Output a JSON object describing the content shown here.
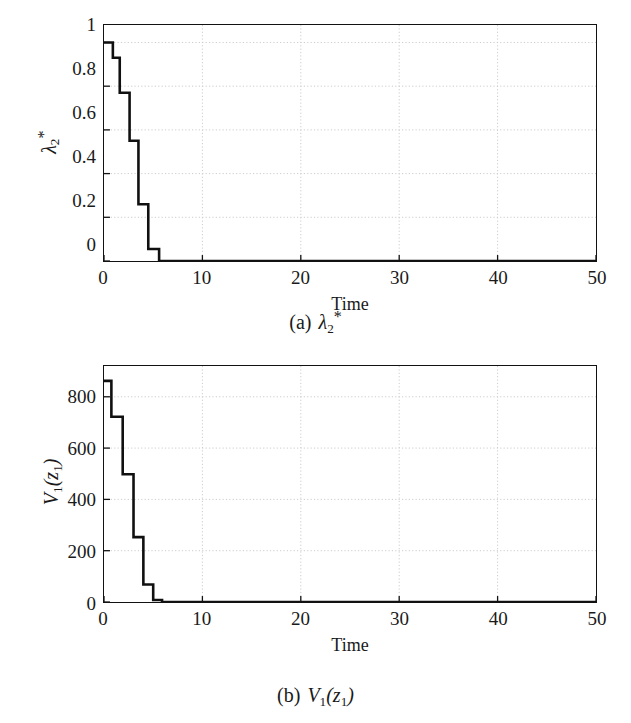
{
  "chart_data": [
    {
      "type": "line",
      "id": "a",
      "title": "",
      "xlabel": "Time",
      "ylabel": "λ₂*",
      "ylabel_parts": {
        "base": "λ",
        "sub": "2",
        "sup": "*"
      },
      "caption_label": "(a)",
      "caption_math": "λ₂*",
      "xlim": [
        0,
        50
      ],
      "ylim": [
        0,
        1.08
      ],
      "xticks": [
        0,
        10,
        20,
        30,
        40,
        50
      ],
      "xtick_labels": [
        "0",
        "10",
        "20",
        "30",
        "40",
        "50"
      ],
      "yticks": [
        0,
        0.2,
        0.4,
        0.6,
        0.8,
        1
      ],
      "ytick_labels": [
        "0",
        "0.2",
        "0.4",
        "0.6",
        "0.8",
        "1"
      ],
      "grid": true,
      "grid_color": "#cccccc",
      "line_color": "#101010",
      "line_width": 2.6,
      "step_style": "post",
      "x": [
        0,
        0.9,
        1.6,
        2.6,
        3.5,
        4.5,
        5.6,
        50
      ],
      "y": [
        1.0,
        0.93,
        0.77,
        0.55,
        0.26,
        0.055,
        0.0,
        0.0
      ]
    },
    {
      "type": "line",
      "id": "b",
      "title": "",
      "xlabel": "Time",
      "ylabel": "V₁(z₁)",
      "ylabel_parts": {
        "base": "V",
        "sub": "1",
        "arg": "z",
        "argsub": "1"
      },
      "caption_label": "(b)",
      "caption_math": "V₁(z₁)",
      "xlim": [
        0,
        50
      ],
      "ylim": [
        0,
        920
      ],
      "xticks": [
        0,
        10,
        20,
        30,
        40,
        50
      ],
      "xtick_labels": [
        "0",
        "10",
        "20",
        "30",
        "40",
        "50"
      ],
      "yticks": [
        0,
        200,
        400,
        600,
        800
      ],
      "ytick_labels": [
        "0",
        "200",
        "400",
        "600",
        "800"
      ],
      "grid": true,
      "grid_color": "#cccccc",
      "line_color": "#101010",
      "line_width": 2.6,
      "step_style": "post",
      "x": [
        0,
        0.75,
        1.9,
        3.0,
        4.0,
        5.0,
        5.9,
        50
      ],
      "y": [
        862,
        722,
        498,
        253,
        68,
        8,
        0,
        0
      ]
    }
  ],
  "figure_a": {
    "caption_label": "(a)",
    "caption_math": "λ₂*",
    "xlabel": "Time",
    "ytick_labels": [
      "1",
      "0.8",
      "0.6",
      "0.4",
      "0.2",
      "0"
    ],
    "xtick_labels": [
      "0",
      "10",
      "20",
      "30",
      "40",
      "50"
    ]
  },
  "figure_b": {
    "caption_label": "(b)",
    "caption_math": "V₁(z₁)",
    "xlabel": "Time",
    "ytick_labels": [
      "800",
      "600",
      "400",
      "200",
      "0"
    ],
    "xtick_labels": [
      "0",
      "10",
      "20",
      "30",
      "40",
      "50"
    ]
  },
  "colors": {
    "line": "#101010",
    "grid": "#cccccc",
    "axis": "#121212",
    "text": "#1a1a1a",
    "background": "#ffffff"
  }
}
